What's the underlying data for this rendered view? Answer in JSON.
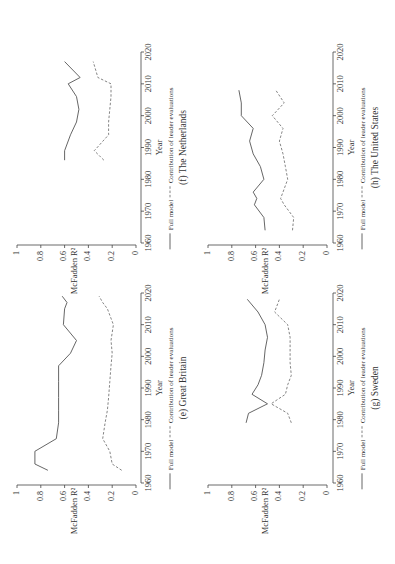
{
  "figure": {
    "orientation": "rotated 90 degrees counter-clockwise (text reads bottom-to-top)",
    "legend": {
      "full_model": "Full model",
      "contribution": "Contribution of leader evaluations"
    },
    "xlabel": "Year",
    "ylabel": "McFadden R²"
  },
  "chart_data": [
    {
      "type": "line",
      "title": "(e) Great Britain",
      "xlabel": "Year",
      "ylabel": "McFadden R²",
      "xticks": [
        1960,
        1970,
        1980,
        1990,
        2000,
        2010,
        2020
      ],
      "yticks": [
        0,
        0.2,
        0.4,
        0.6,
        0.8,
        1
      ],
      "ylim": [
        0,
        1
      ],
      "xlim": [
        1960,
        2020
      ],
      "legend": [
        "Full model",
        "Contribution of leader evaluations"
      ],
      "legend_position": "below x-axis",
      "series": [
        {
          "name": "Full model",
          "style": "solid",
          "x": [
            1964,
            1966,
            1970,
            1974,
            1979,
            1983,
            1987,
            1992,
            1997,
            2001,
            2005,
            2010,
            2015,
            2017,
            2019
          ],
          "values": [
            0.74,
            0.85,
            0.85,
            0.67,
            0.65,
            0.65,
            0.65,
            0.65,
            0.65,
            0.55,
            0.5,
            0.61,
            0.6,
            0.58,
            0.62
          ]
        },
        {
          "name": "Contribution of leader evaluations",
          "style": "dashed",
          "x": [
            1964,
            1966,
            1970,
            1974,
            1979,
            1983,
            1987,
            1992,
            1997,
            2001,
            2005,
            2010,
            2015,
            2017,
            2019
          ],
          "values": [
            0.12,
            0.2,
            0.22,
            0.28,
            0.26,
            0.24,
            0.23,
            0.22,
            0.21,
            0.2,
            0.21,
            0.19,
            0.24,
            0.28,
            0.31
          ]
        }
      ]
    },
    {
      "type": "line",
      "title": "(f) The Netherlands",
      "xlabel": "Year",
      "ylabel": "McFadden R²",
      "xticks": [
        1960,
        1970,
        1980,
        1990,
        2000,
        2010,
        2020
      ],
      "yticks": [
        0,
        0.2,
        0.4,
        0.6,
        0.8,
        1
      ],
      "ylim": [
        0,
        1
      ],
      "xlim": [
        1960,
        2020
      ],
      "legend": [
        "Full model",
        "Contribution of leader evaluations"
      ],
      "legend_position": "below x-axis",
      "series": [
        {
          "name": "Full model",
          "style": "solid",
          "x": [
            1986,
            1989,
            1994,
            1998,
            2002,
            2006,
            2010,
            2012,
            2017
          ],
          "values": [
            0.6,
            0.6,
            0.55,
            0.5,
            0.48,
            0.5,
            0.57,
            0.47,
            0.6
          ]
        },
        {
          "name": "Contribution of leader evaluations",
          "style": "dashed",
          "x": [
            1986,
            1989,
            1994,
            1998,
            2002,
            2006,
            2010,
            2012,
            2017
          ],
          "values": [
            0.27,
            0.35,
            0.23,
            0.23,
            0.22,
            0.21,
            0.21,
            0.32,
            0.36
          ]
        }
      ]
    },
    {
      "type": "line",
      "title": "(g) Sweden",
      "xlabel": "Year",
      "ylabel": "McFadden R²",
      "xticks": [
        1960,
        1970,
        1980,
        1990,
        2000,
        2010,
        2020
      ],
      "yticks": [
        0,
        0.2,
        0.4,
        0.6,
        0.8,
        1
      ],
      "ylim": [
        0,
        1
      ],
      "xlim": [
        1960,
        2020
      ],
      "legend": [
        "Full model",
        "Contribution of leader evaluations"
      ],
      "legend_position": "below x-axis",
      "series": [
        {
          "name": "Full model",
          "style": "solid",
          "x": [
            1979,
            1982,
            1985,
            1988,
            1991,
            1994,
            1998,
            2002,
            2006,
            2010,
            2014,
            2018
          ],
          "values": [
            0.68,
            0.66,
            0.5,
            0.63,
            0.58,
            0.55,
            0.53,
            0.52,
            0.5,
            0.52,
            0.58,
            0.67
          ]
        },
        {
          "name": "Contribution of leader evaluations",
          "style": "dashed",
          "x": [
            1979,
            1982,
            1985,
            1988,
            1991,
            1994,
            1998,
            2002,
            2006,
            2010,
            2014,
            2018
          ],
          "values": [
            0.3,
            0.33,
            0.47,
            0.35,
            0.33,
            0.3,
            0.31,
            0.31,
            0.31,
            0.33,
            0.44,
            0.4
          ]
        }
      ]
    },
    {
      "type": "line",
      "title": "(h) The United States",
      "xlabel": "Year",
      "ylabel": "McFadden R²",
      "xticks": [
        1960,
        1970,
        1980,
        1990,
        2000,
        2010,
        2020
      ],
      "yticks": [
        0,
        0.2,
        0.4,
        0.6,
        0.8,
        1
      ],
      "ylim": [
        0,
        1
      ],
      "xlim": [
        1960,
        2020
      ],
      "legend": [
        "Full model",
        "Contribution of leader evaluations"
      ],
      "legend_position": "below x-axis",
      "series": [
        {
          "name": "Full model",
          "style": "solid",
          "x": [
            1964,
            1968,
            1972,
            1974,
            1976,
            1980,
            1984,
            1988,
            1992,
            1996,
            2000,
            2004,
            2008
          ],
          "values": [
            0.52,
            0.53,
            0.61,
            0.59,
            0.62,
            0.53,
            0.56,
            0.62,
            0.65,
            0.62,
            0.72,
            0.72,
            0.74
          ]
        },
        {
          "name": "Contribution of leader evaluations",
          "style": "dashed",
          "x": [
            1964,
            1968,
            1972,
            1974,
            1976,
            1980,
            1984,
            1988,
            1992,
            1996,
            2000,
            2004,
            2008
          ],
          "values": [
            0.29,
            0.28,
            0.36,
            0.39,
            0.37,
            0.33,
            0.35,
            0.37,
            0.4,
            0.37,
            0.46,
            0.36,
            0.43
          ]
        }
      ]
    }
  ],
  "panels_layout": [
    {
      "chart_index": 1,
      "r0_x": 136,
      "r1_x": 17,
      "y1960": 243,
      "y2020": 52,
      "year_axis_x": 141
    },
    {
      "chart_index": 3,
      "r0_x": 327,
      "r1_x": 208,
      "y1960": 243,
      "y2020": 52,
      "year_axis_x": 333
    },
    {
      "chart_index": 0,
      "r0_x": 136,
      "r1_x": 17,
      "y1960": 483,
      "y2020": 293,
      "year_axis_x": 141
    },
    {
      "chart_index": 2,
      "r0_x": 327,
      "r1_x": 208,
      "y1960": 483,
      "y2020": 293,
      "year_axis_x": 333
    }
  ]
}
